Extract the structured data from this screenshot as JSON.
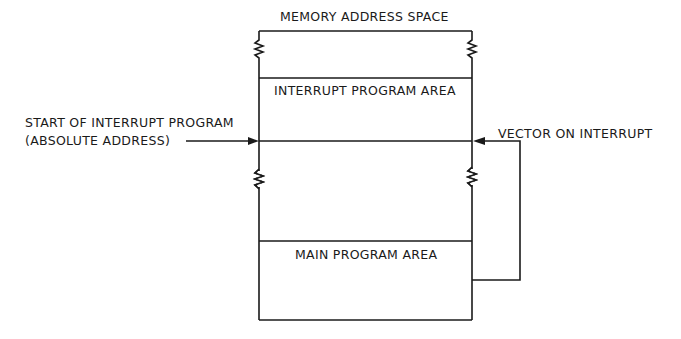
{
  "diagram": {
    "title": "MEMORY ADDRESS SPACE",
    "regions": {
      "interrupt": "INTERRUPT PROGRAM AREA",
      "main": "MAIN PROGRAM AREA"
    },
    "left_label": {
      "line1": "START OF INTERRUPT PROGRAM",
      "line2": "(ABSOLUTE ADDRESS)"
    },
    "right_label": "VECTOR ON INTERRUPT",
    "colors": {
      "stroke": "#1a1a1a",
      "background": "#ffffff"
    }
  }
}
